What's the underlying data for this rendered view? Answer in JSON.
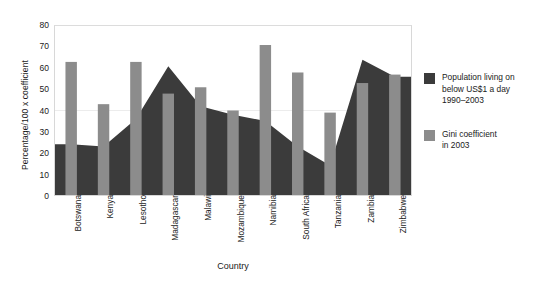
{
  "chart_data": {
    "type": "area",
    "title": "",
    "xlabel": "Country",
    "ylabel": "Percentage/100 x coefficient",
    "ylim": [
      0,
      80
    ],
    "ytick_step": 10,
    "yticks": [
      80,
      70,
      60,
      50,
      40,
      30,
      20,
      10,
      0
    ],
    "grid": "single faint horizontal line at 40",
    "legend_position": "right",
    "categories": [
      "Botswana",
      "Kenya",
      "Lesotho",
      "Madagascar",
      "Malawi",
      "Mozambique",
      "Namibia",
      "South Africa",
      "Tanzania",
      "Zambia",
      "Zimbabwe"
    ],
    "series": [
      {
        "name": "Population living on below US$1 a day 1990–2003",
        "type": "area",
        "color": "#3b3b3b",
        "values": [
          24,
          23,
          36,
          61,
          42,
          38,
          35,
          23,
          14,
          64,
          56
        ]
      },
      {
        "name": "Gini coefficient in 2003",
        "type": "bar",
        "color": "#8c8c8c",
        "values": [
          63,
          43,
          63,
          48,
          51,
          40,
          71,
          58,
          39,
          53,
          57
        ]
      }
    ]
  },
  "legend": {
    "items": [
      {
        "swatch": "#3b3b3b",
        "line1": "Population living on",
        "line2": "below US$1 a day",
        "line3": "1990–2003"
      },
      {
        "swatch": "#8c8c8c",
        "line1": "Gini coefficient",
        "line2": "in 2003",
        "line3": ""
      }
    ]
  },
  "colors": {
    "area": "#3b3b3b",
    "bar": "#8c8c8c",
    "plot_border": "#d8d8d8",
    "gridline": "#ececec",
    "background": "#ffffff",
    "text": "#1a1a1a"
  }
}
